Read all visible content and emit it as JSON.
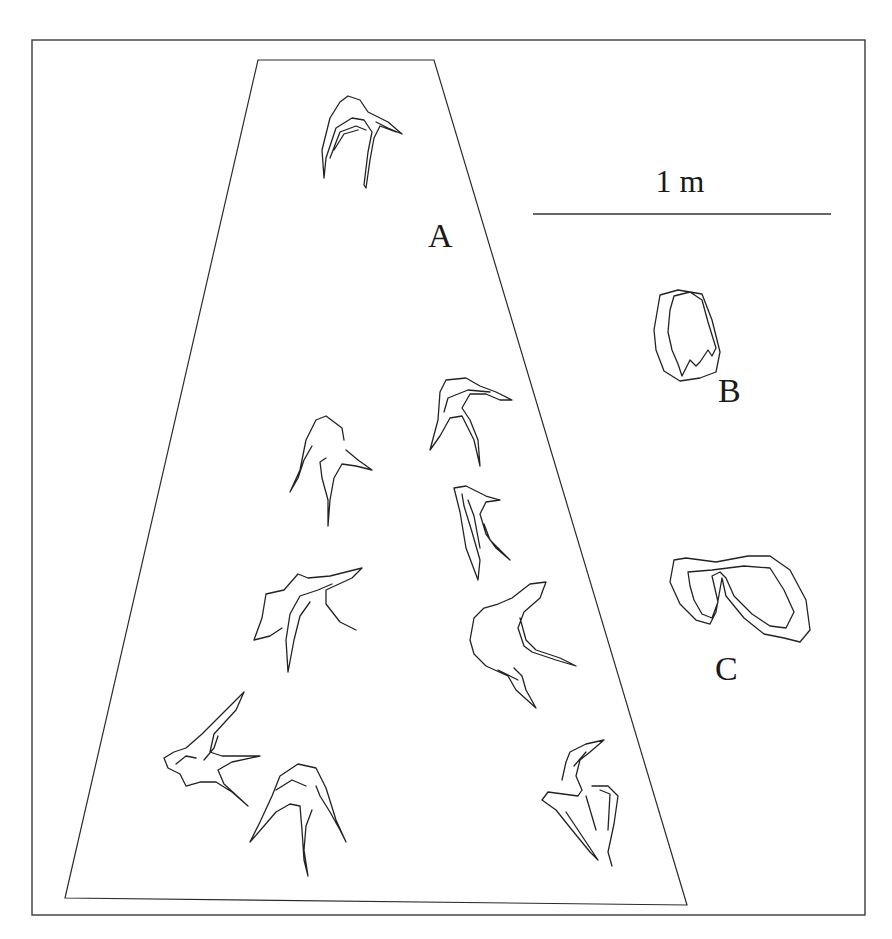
{
  "figure": {
    "width": 892,
    "height": 939,
    "frame": {
      "x": 32,
      "y": 40,
      "w": 833,
      "h": 875
    },
    "trackway_outline": "M258,60 L434,60 L687,905 L65,898 Z",
    "labels": {
      "trackway": "A",
      "track_b": "B",
      "track_c": "C",
      "scale": "1 m"
    },
    "scale_bar": {
      "x1": 533,
      "x2": 831,
      "y": 214,
      "label_x": 680,
      "label_y": 192
    },
    "colors": {
      "line": "#222222",
      "background": "#ffffff"
    },
    "tracks": [
      {
        "name": "track-a1",
        "d": "M324,178 L322,150 L330,118 L340,102 L348,96 L360,100 L368,112 L388,122 L402,134 L388,128 L376,122 M324,178 L326,158 L336,128 L352,118 L364,120 L372,132 L368,152 L364,185 L366,188 L370,160 L374,138 L380,126 L396,132 M330,158 L340,132 L356,126 L366,130 M334,150 L344,134 L358,130"
      },
      {
        "name": "track-a2",
        "d": "M430,450 L438,420 L440,392 L446,380 L466,378 L480,386 L496,392 L512,400 L500,400 L486,394 L470,394 L462,408 L470,420 L478,440 L480,466 L474,440 L462,416 L450,418 L440,436 L430,450 M448,398 L468,390 L490,392 M444,412 L448,398"
      },
      {
        "name": "track-a3",
        "d": "M290,492 L300,470 L306,440 L316,420 L326,416 L342,428 L344,440 M290,492 L298,478 L304,460 L312,446 M328,526 L328,500 L322,478 L320,462 L326,458 M328,526 L330,500 L334,478 L342,464 L356,466 L372,470 L358,460 L346,450"
      },
      {
        "name": "track-a4",
        "d": "M454,488 L466,486 L486,496 L500,500 L486,502 L480,514 L486,534 L496,548 L510,560 L500,550 L490,540 L484,524 M454,488 L460,512 L466,548 L478,580 L480,560 L472,532 L464,506 L462,494 M468,500 L474,516 L480,548"
      },
      {
        "name": "track-a5",
        "d": "M254,640 L262,618 L266,594 L284,590 L298,574 L308,578 L330,576 L362,568 L352,578 L326,590 L326,604 L340,622 L356,630 M254,640 L270,636 L282,628 M288,672 L286,640 L290,614 L300,596 L318,590 L332,584 M288,672 L294,640 L300,616 L310,602"
      },
      {
        "name": "track-a6",
        "d": "M470,640 L474,618 L484,608 L498,604 L512,598 L530,584 L546,582 L540,598 L524,612 L518,628 L524,646 L532,652 L556,660 L576,666 L560,658 L536,650 L526,640 L520,618 M470,640 L474,654 L486,666 L508,676 L516,690 L536,708 L526,690 L522,676 L514,668 M498,670 L510,676 L518,680"
      },
      {
        "name": "track-a7",
        "d": "M164,758 L174,752 L186,748 L202,734 L226,710 L244,692 L236,710 L214,734 L210,752 L222,756 L260,756 L232,762 L218,770 L224,784 L248,806 L232,792 L216,782 L200,782 L186,786 L180,774 L168,768 Z M176,764 L186,756 L196,758 M204,760 L214,748 L218,736"
      },
      {
        "name": "track-a8",
        "d": "M250,842 L260,822 L272,796 L280,776 L298,764 L316,768 L326,788 L336,820 L346,842 L340,830 L330,812 L320,796 L316,786 M250,842 L264,826 L276,812 L290,804 L300,806 L302,830 L304,860 L308,876 L304,850 L306,826 L312,810 M276,790 L292,780 L306,786"
      },
      {
        "name": "track-a9",
        "d": "M562,780 L566,762 L570,752 L586,744 L604,740 L590,752 L580,760 L576,776 L582,790 L578,796 L548,792 L542,800 L556,810 L572,830 L590,852 L598,860 L582,836 L566,812 M574,766 L586,752 M586,796 L596,830 M592,786 L608,786 L618,796 L614,824 L608,852 L612,866 M600,790 L610,794 L608,830"
      },
      {
        "name": "track-b",
        "d": "M660,295 L678,290 L702,294 L712,320 L720,352 L716,372 L700,378 L680,381 L664,371 L656,350 L654,330 Z M674,296 L690,292 L702,300 L708,322 L716,348 L712,356 L708,350 L700,362 L696,366 L690,360 L682,376 L678,364 L672,350 L668,332 L670,310 Z"
      },
      {
        "name": "track-c",
        "d": "M674,560 L686,558 L716,562 L748,556 L770,556 L790,570 L806,600 L810,630 L800,642 L784,638 L764,634 L744,618 L726,596 L722,578 L716,612 L710,624 L696,620 L680,604 L670,582 Z M688,572 L712,570 L744,566 L770,568 L784,590 L794,612 L790,620 L786,628 L770,626 L752,614 L734,596 L726,578 L720,572 L712,576 L718,602 L712,618 L702,614 L694,600 L690,586 Z"
      }
    ]
  }
}
